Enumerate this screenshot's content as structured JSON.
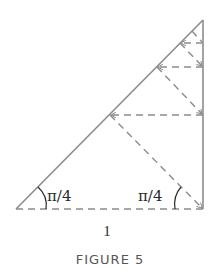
{
  "figure": {
    "caption": "FIGURE 5",
    "base_label": "1",
    "angle_left_label": "π/4",
    "angle_right_label": "π/4"
  },
  "colors": {
    "line": "#8c8c8c",
    "text": "#2a2a2a",
    "caption": "#555555"
  },
  "geometry": {
    "triangle": {
      "base_left": [
        16,
        209
      ],
      "base_right": [
        203,
        209
      ],
      "apex": [
        203,
        20
      ]
    },
    "solid_edges": [
      "hypotenuse",
      "right_side"
    ],
    "dashed_edges": [
      "base"
    ],
    "dashed_path": [
      [
        203,
        209
      ],
      [
        110,
        115
      ],
      [
        203,
        115
      ],
      [
        157,
        67
      ],
      [
        203,
        67
      ],
      [
        180,
        43
      ],
      [
        203,
        43
      ],
      [
        192,
        32
      ],
      [
        203,
        32
      ]
    ]
  }
}
